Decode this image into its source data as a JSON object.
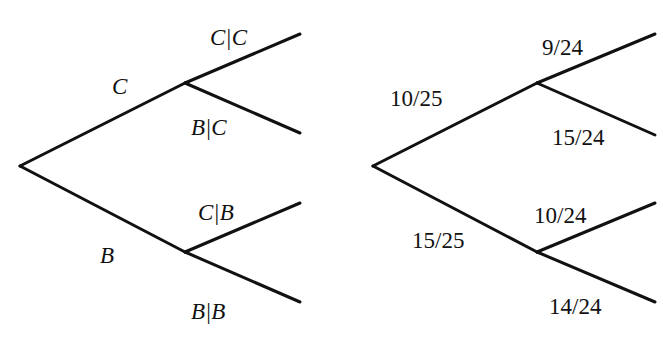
{
  "trees": [
    {
      "name": "symbolic-tree",
      "root": [
        20,
        166
      ],
      "nodes": {
        "upper": [
          185,
          83
        ],
        "lower": [
          185,
          252
        ]
      },
      "tips": [
        [
          300,
          34
        ],
        [
          300,
          133
        ],
        [
          300,
          203
        ],
        [
          300,
          302
        ]
      ],
      "labels": {
        "first_upper": "C",
        "first_lower": "B",
        "upper_upper": "C|C",
        "upper_lower": "B|C",
        "lower_upper": "C|B",
        "lower_lower": "B|B"
      }
    },
    {
      "name": "numeric-tree",
      "root": [
        373,
        166
      ],
      "nodes": {
        "upper": [
          537,
          83
        ],
        "lower": [
          537,
          252
        ]
      },
      "tips": [
        [
          655,
          34
        ],
        [
          655,
          135
        ],
        [
          655,
          203
        ],
        [
          655,
          302
        ]
      ],
      "labels": {
        "first_upper": "10/25",
        "first_lower": "15/25",
        "upper_upper": "9/24",
        "upper_lower": "15/24",
        "lower_upper": "10/24",
        "lower_lower": "14/24"
      }
    }
  ],
  "colors": {
    "line": "#111111",
    "background": "#ffffff"
  }
}
